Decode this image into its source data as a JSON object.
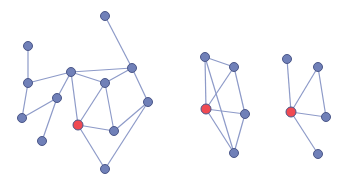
{
  "colors": {
    "background": "#ffffff",
    "edge": "#8d9ac8",
    "node": "#7080b8",
    "node_stroke": "#4a5688",
    "highlight": "#f04a52"
  },
  "graphs": [
    {
      "name": "graph-1",
      "nodes": [
        {
          "id": 0,
          "x": 105,
          "y": 16
        },
        {
          "id": 1,
          "x": 28,
          "y": 46
        },
        {
          "id": 2,
          "x": 71,
          "y": 72
        },
        {
          "id": 3,
          "x": 132,
          "y": 68
        },
        {
          "id": 4,
          "x": 28,
          "y": 83
        },
        {
          "id": 5,
          "x": 105,
          "y": 83
        },
        {
          "id": 6,
          "x": 57,
          "y": 98
        },
        {
          "id": 7,
          "x": 148,
          "y": 102
        },
        {
          "id": 8,
          "x": 22,
          "y": 118
        },
        {
          "id": 9,
          "x": 78,
          "y": 125,
          "highlight": true
        },
        {
          "id": 10,
          "x": 114,
          "y": 131
        },
        {
          "id": 11,
          "x": 42,
          "y": 141
        },
        {
          "id": 12,
          "x": 105,
          "y": 169
        }
      ],
      "edges": [
        [
          0,
          3
        ],
        [
          1,
          4
        ],
        [
          4,
          2
        ],
        [
          4,
          8
        ],
        [
          2,
          3
        ],
        [
          2,
          5
        ],
        [
          2,
          6
        ],
        [
          2,
          9
        ],
        [
          6,
          8
        ],
        [
          6,
          11
        ],
        [
          3,
          5
        ],
        [
          3,
          7
        ],
        [
          5,
          9
        ],
        [
          5,
          10
        ],
        [
          9,
          10
        ],
        [
          9,
          12
        ],
        [
          7,
          10
        ],
        [
          7,
          12
        ]
      ]
    },
    {
      "name": "graph-2",
      "nodes": [
        {
          "id": 0,
          "x": 205,
          "y": 57
        },
        {
          "id": 1,
          "x": 234,
          "y": 67
        },
        {
          "id": 2,
          "x": 206,
          "y": 109,
          "highlight": true
        },
        {
          "id": 3,
          "x": 245,
          "y": 114
        },
        {
          "id": 4,
          "x": 234,
          "y": 153
        }
      ],
      "edges": [
        [
          0,
          1
        ],
        [
          0,
          2
        ],
        [
          0,
          4
        ],
        [
          1,
          2
        ],
        [
          1,
          3
        ],
        [
          2,
          3
        ],
        [
          2,
          4
        ],
        [
          3,
          4
        ]
      ]
    },
    {
      "name": "graph-3",
      "nodes": [
        {
          "id": 0,
          "x": 287,
          "y": 59
        },
        {
          "id": 1,
          "x": 318,
          "y": 67
        },
        {
          "id": 2,
          "x": 291,
          "y": 112,
          "highlight": true
        },
        {
          "id": 3,
          "x": 326,
          "y": 117
        },
        {
          "id": 4,
          "x": 318,
          "y": 154
        }
      ],
      "edges": [
        [
          0,
          2
        ],
        [
          1,
          2
        ],
        [
          1,
          3
        ],
        [
          2,
          3
        ],
        [
          2,
          4
        ]
      ]
    }
  ]
}
